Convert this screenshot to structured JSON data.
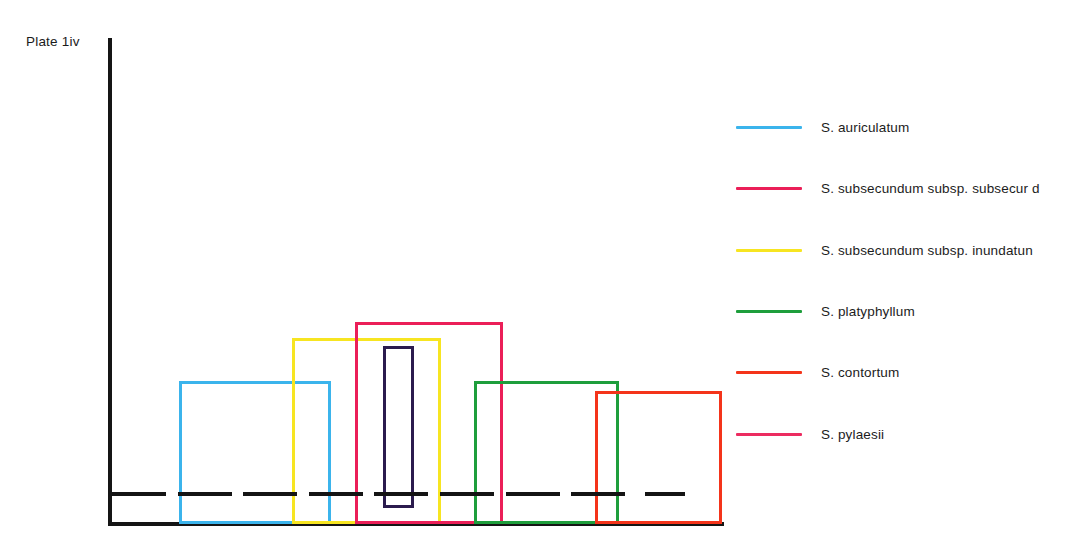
{
  "figure": {
    "plate_label": "Plate 1iv",
    "axis_color": "#151515"
  },
  "legend": {
    "items": [
      {
        "label": "S. auriculatum",
        "color": "#3BB4EC",
        "swatch_name": "legend-swatch-auriculatum",
        "top": 12
      },
      {
        "label": "S. subsecundum subsp. subsecur d",
        "color": "#EB1F58",
        "swatch_name": "legend-swatch-subsecundum-subsecundum",
        "top": 73
      },
      {
        "label": "S. subsecundum subsp. inundatun",
        "color": "#F7E521",
        "swatch_name": "legend-swatch-subsecundum-inundatum",
        "top": 135
      },
      {
        "label": "S. platyphyllum",
        "color": "#1E9E3C",
        "swatch_name": "legend-swatch-platyphyllum",
        "top": 196
      },
      {
        "label": "S. contortum",
        "color": "#F4341A",
        "swatch_name": "legend-swatch-contortum",
        "top": 257
      },
      {
        "label": "S. pylaesii",
        "color": "#EC2C60",
        "swatch_name": "legend-swatch-pylaesii",
        "top": 319
      }
    ]
  },
  "chart_data": {
    "type": "box",
    "title": "Plate 1iv",
    "xlabel": "",
    "ylabel": "",
    "grid": false,
    "legend_position": "right",
    "axis": {
      "x_start_px": 108,
      "x_end_px": 724,
      "y_top_px": 38,
      "y_baseline_px": 524,
      "tick_labels": [],
      "y_tick_labels": []
    },
    "series": [
      {
        "name": "S. auriculatum",
        "color": "#3BB4EC",
        "box_left_px": 179,
        "box_right_px": 331,
        "box_top_px": 381,
        "box_bottom_px": 524,
        "median_px": 494
      },
      {
        "name": "S. subsecundum subsp. subsecur d",
        "color": "#EB1F58",
        "box_left_px": 355,
        "box_right_px": 503,
        "box_top_px": 322,
        "box_bottom_px": 524,
        "median_px": 494
      },
      {
        "name": "S. subsecundum subsp. inundatun",
        "color": "#F7E521",
        "box_left_px": 292,
        "box_right_px": 441,
        "box_top_px": 338,
        "box_bottom_px": 524,
        "median_px": 494
      },
      {
        "name": "S. platyphyllum",
        "color": "#1E9E3C",
        "box_left_px": 474,
        "box_right_px": 619,
        "box_top_px": 381,
        "box_bottom_px": 524,
        "median_px": 494
      },
      {
        "name": "S. contortum",
        "color": "#F4341A",
        "box_left_px": 595,
        "box_right_px": 722,
        "box_top_px": 391,
        "box_bottom_px": 524,
        "median_px": 494
      },
      {
        "name": "S. pylaesii",
        "color": "#2B1B4E",
        "box_left_px": 383,
        "box_right_px": 414,
        "box_top_px": 346,
        "box_bottom_px": 508,
        "median_px": 494
      }
    ],
    "median_dashes_px": [
      {
        "left": 112,
        "width": 54
      },
      {
        "left": 178,
        "width": 54
      },
      {
        "left": 243,
        "width": 54
      },
      {
        "left": 309,
        "width": 54
      },
      {
        "left": 374,
        "width": 54
      },
      {
        "left": 440,
        "width": 54
      },
      {
        "left": 506,
        "width": 54
      },
      {
        "left": 571,
        "width": 54
      },
      {
        "left": 645,
        "width": 40
      }
    ]
  }
}
